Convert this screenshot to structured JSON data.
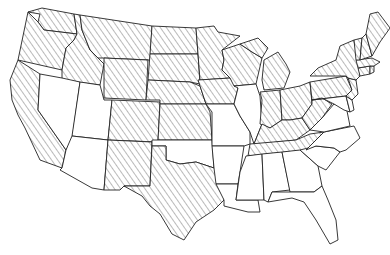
{
  "map": {
    "title": "",
    "region": "United States (contiguous)",
    "style": {
      "hatch_color": "#666666",
      "border_color": "#222222",
      "background": "#ffffff"
    },
    "legend": [],
    "states": [
      {
        "id": "WA",
        "hatched": true
      },
      {
        "id": "OR",
        "hatched": true
      },
      {
        "id": "CA",
        "hatched": true
      },
      {
        "id": "ID",
        "hatched": true
      },
      {
        "id": "NV",
        "hatched": false
      },
      {
        "id": "UT",
        "hatched": false
      },
      {
        "id": "AZ",
        "hatched": false
      },
      {
        "id": "MT",
        "hatched": true
      },
      {
        "id": "WY",
        "hatched": true
      },
      {
        "id": "CO",
        "hatched": true
      },
      {
        "id": "NM",
        "hatched": true
      },
      {
        "id": "ND",
        "hatched": true
      },
      {
        "id": "SD",
        "hatched": true
      },
      {
        "id": "NE",
        "hatched": true
      },
      {
        "id": "KS",
        "hatched": true
      },
      {
        "id": "OK",
        "hatched": false
      },
      {
        "id": "TX",
        "hatched": true
      },
      {
        "id": "MN",
        "hatched": true
      },
      {
        "id": "IA",
        "hatched": true
      },
      {
        "id": "MO",
        "hatched": false
      },
      {
        "id": "AR",
        "hatched": false
      },
      {
        "id": "LA",
        "hatched": false
      },
      {
        "id": "WI",
        "hatched": true
      },
      {
        "id": "IL",
        "hatched": false
      },
      {
        "id": "MI",
        "hatched": true
      },
      {
        "id": "IN",
        "hatched": true
      },
      {
        "id": "OH",
        "hatched": true
      },
      {
        "id": "KY",
        "hatched": true
      },
      {
        "id": "TN",
        "hatched": true
      },
      {
        "id": "MS",
        "hatched": false
      },
      {
        "id": "AL",
        "hatched": false
      },
      {
        "id": "GA",
        "hatched": false
      },
      {
        "id": "FL",
        "hatched": false
      },
      {
        "id": "SC",
        "hatched": false
      },
      {
        "id": "NC",
        "hatched": false
      },
      {
        "id": "VA",
        "hatched": false
      },
      {
        "id": "WV",
        "hatched": true
      },
      {
        "id": "PA",
        "hatched": true
      },
      {
        "id": "NY",
        "hatched": true
      },
      {
        "id": "MD",
        "hatched": false
      },
      {
        "id": "DE",
        "hatched": false
      },
      {
        "id": "NJ",
        "hatched": true
      },
      {
        "id": "CT",
        "hatched": true
      },
      {
        "id": "RI",
        "hatched": true
      },
      {
        "id": "MA",
        "hatched": true
      },
      {
        "id": "VT",
        "hatched": true
      },
      {
        "id": "NH",
        "hatched": true
      },
      {
        "id": "ME",
        "hatched": true
      }
    ]
  }
}
